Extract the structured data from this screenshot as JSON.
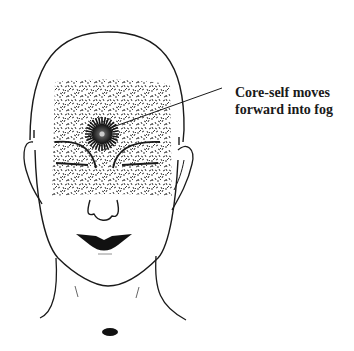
{
  "figure": {
    "annotation": {
      "line1": "Core-self moves",
      "line2": "forward into fog"
    },
    "colors": {
      "ink": "#1a1a1a",
      "background": "#ffffff"
    }
  }
}
